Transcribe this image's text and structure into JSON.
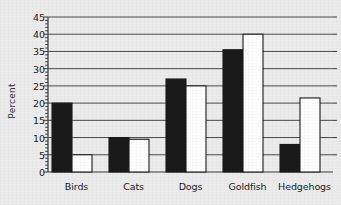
{
  "chart_data": {
    "type": "bar",
    "title": "",
    "subtitle": "",
    "xlabel": "",
    "ylabel": "Percent",
    "categories": [
      "Birds",
      "Cats",
      "Dogs",
      "Goldfish",
      "Hedgehogs"
    ],
    "series": [
      {
        "name": "black",
        "color": "#1a1a1a",
        "values": [
          20,
          10,
          27,
          35.5,
          8
        ]
      },
      {
        "name": "white",
        "color": "#fdfdfd",
        "values": [
          5,
          9.5,
          25,
          40,
          21.5
        ]
      }
    ],
    "ylim": [
      0,
      45
    ],
    "yticks": [
      0,
      5,
      10,
      15,
      20,
      25,
      30,
      35,
      40,
      45
    ],
    "ytick_labels": [
      "0",
      "5",
      "10",
      "15",
      "20",
      "25",
      "30",
      "35",
      "40",
      "45"
    ],
    "minor_tick_step": 1,
    "grid": true,
    "grid_axis": "y",
    "legend": "none",
    "legend_position": "none",
    "annotations": [],
    "background_color": "#ebebeb",
    "axis_color": "#3a3a3a",
    "grid_color": "#4a4a4a",
    "bar_edge_color": "#1a1a1a"
  }
}
